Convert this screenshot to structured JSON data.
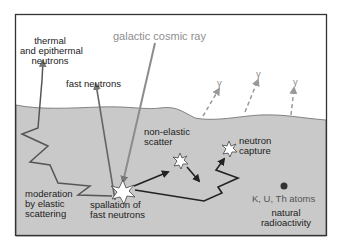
{
  "diagram": {
    "colors": {
      "frame": "#333333",
      "ground": "#c8c8c8",
      "ground_edge": "#666666",
      "cosmic_ray": "#8c8c8c",
      "neutron_path": "#222222",
      "gamma": "#9a9a9a",
      "atom": "#333333"
    },
    "labels": {
      "cosmic_ray": "galactic cosmic ray",
      "thermal_line1": "thermal",
      "thermal_line2": "and epithermal",
      "thermal_line3": "neutrons",
      "fast_neutrons": "fast neutrons",
      "nonelastic_line1": "non-elastic",
      "nonelastic_line2": "scatter",
      "capture_line1": "neutron",
      "capture_line2": "capture",
      "moderation_line1": "moderation",
      "moderation_line2": "by elastic",
      "moderation_line3": "scattering",
      "spallation_line1": "spallation of",
      "spallation_line2": "fast neutrons",
      "atoms": "K, U, Th atoms",
      "natural_line1": "natural",
      "natural_line2": "radioactivity",
      "gamma_symbol": "γ"
    }
  }
}
